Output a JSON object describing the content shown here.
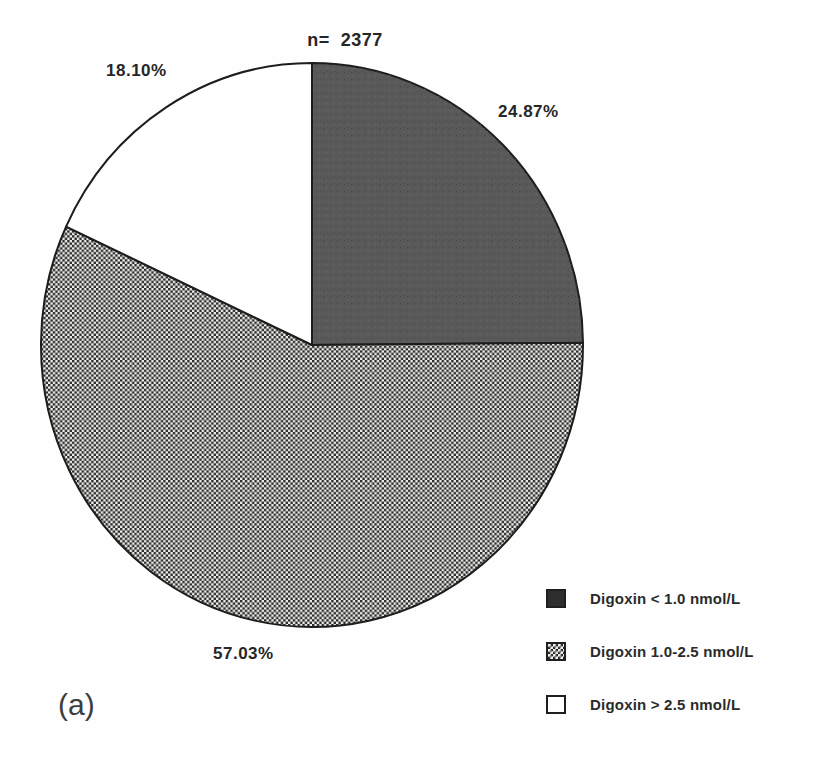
{
  "panel_label": "(a)",
  "chart_data": {
    "type": "pie",
    "title": "",
    "n_label": "n=  2377",
    "n": 2377,
    "start_angle_deg": 0,
    "direction": "clockwise",
    "legend_position": "bottom-right",
    "background_color": "#fefefe",
    "outline_color": "#1d1d1d",
    "slices": [
      {
        "label": "Digoxin < 1.0 nmol/L",
        "value": 24.87,
        "display": "24.87%",
        "fill_style": "solid-gray",
        "pie_color": "#595959",
        "swatch_color": "#2e2e2e"
      },
      {
        "label": "Digoxin 1.0-2.5 nmol/L",
        "value": 57.03,
        "display": "57.03%",
        "fill_style": "stipple",
        "pie_color": "#8f8f8f",
        "swatch_color": "#8f8f8f"
      },
      {
        "label": "Digoxin > 2.5 nmol/L",
        "value": 18.1,
        "display": "18.10%",
        "fill_style": "white",
        "pie_color": "#ffffff",
        "swatch_color": "#ffffff"
      }
    ]
  }
}
